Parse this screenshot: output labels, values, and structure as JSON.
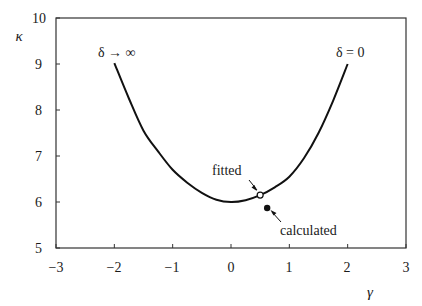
{
  "chart_data": {
    "type": "line",
    "title": "",
    "xlabel": "γ",
    "ylabel": "κ",
    "xlim": [
      -3,
      3
    ],
    "ylim": [
      5,
      10
    ],
    "x_ticks": [
      -3,
      -2,
      -1,
      0,
      1,
      2,
      3
    ],
    "x_tick_labels": [
      "−3",
      "−2",
      "−1",
      "0",
      "1",
      "2",
      "3"
    ],
    "y_ticks": [
      5,
      6,
      7,
      8,
      9,
      10
    ],
    "y_tick_labels": [
      "5",
      "6",
      "7",
      "8",
      "9",
      "10"
    ],
    "grid": false,
    "legend": null,
    "series": [
      {
        "name": "κ(γ) curve",
        "style": "solid-black",
        "x": [
          -2.0,
          -1.75,
          -1.5,
          -1.25,
          -1.0,
          -0.75,
          -0.5,
          -0.25,
          0.0,
          0.25,
          0.5,
          0.75,
          1.0,
          1.25,
          1.5,
          1.75,
          2.0
        ],
        "y": [
          9.02,
          8.25,
          7.55,
          7.1,
          6.7,
          6.42,
          6.2,
          6.05,
          6.0,
          6.04,
          6.15,
          6.32,
          6.55,
          6.95,
          7.5,
          8.2,
          9.0
        ]
      },
      {
        "name": "fitted",
        "style": "open-circle",
        "x": [
          0.5
        ],
        "y": [
          6.15
        ]
      },
      {
        "name": "calculated",
        "style": "filled-circle",
        "x": [
          0.62
        ],
        "y": [
          5.87
        ]
      }
    ],
    "annotations": [
      {
        "text": "δ → ∞",
        "x": -1.9,
        "y": 9.3,
        "points_to": "left end of curve"
      },
      {
        "text": "δ = 0",
        "x": 1.95,
        "y": 9.3,
        "points_to": "right end of curve"
      },
      {
        "text": "fitted",
        "x": 0.1,
        "y": 6.55,
        "arrow_to": [
          0.48,
          6.17
        ]
      },
      {
        "text": "calculated",
        "x": 0.95,
        "y": 5.45,
        "arrow_to": [
          0.68,
          5.8
        ]
      }
    ]
  },
  "labels": {
    "xlabel": "γ",
    "ylabel": "κ",
    "ann_delta_inf": "δ → ∞",
    "ann_delta_zero": "δ = 0",
    "ann_fitted": "fitted",
    "ann_calculated": "calculated",
    "xticks": [
      "−3",
      "−2",
      "−1",
      "0",
      "1",
      "2",
      "3"
    ],
    "yticks": [
      "5",
      "6",
      "7",
      "8",
      "9",
      "10"
    ]
  }
}
